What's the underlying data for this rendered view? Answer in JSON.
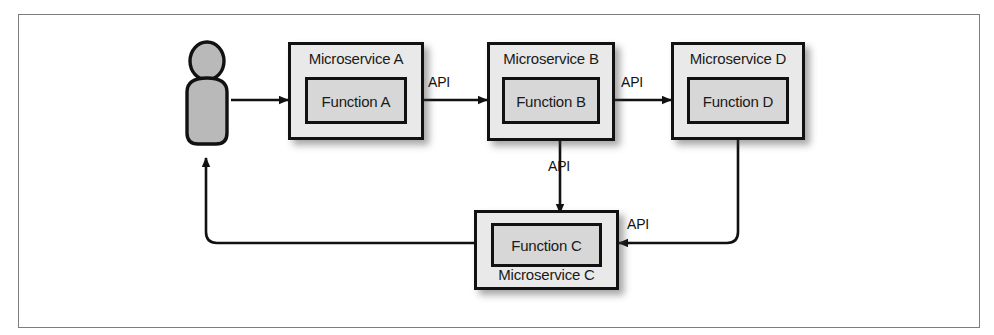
{
  "diagram": {
    "frame": {
      "border_color": "#7d7d7d"
    },
    "colors": {
      "service_fill": "#e9e9e9",
      "function_fill": "#d7d7d7",
      "stroke": "#111111",
      "actor_fill": "#b8b8b8"
    },
    "actor": {
      "name": "user-actor",
      "label": ""
    },
    "services": [
      {
        "id": "a",
        "service_label": "Microservice A",
        "function_label": "Function A",
        "label_position": "top"
      },
      {
        "id": "b",
        "service_label": "Microservice B",
        "function_label": "Function B",
        "label_position": "top"
      },
      {
        "id": "d",
        "service_label": "Microservice D",
        "function_label": "Function D",
        "label_position": "top"
      },
      {
        "id": "c",
        "service_label": "Microservice C",
        "function_label": "Function C",
        "label_position": "bottom"
      }
    ],
    "connections": [
      {
        "id": "user-to-a",
        "label": "",
        "from": "user",
        "to": "Function A"
      },
      {
        "id": "a-to-b",
        "label": "API",
        "from": "Function A",
        "to": "Function B"
      },
      {
        "id": "b-to-d",
        "label": "API",
        "from": "Function B",
        "to": "Function D"
      },
      {
        "id": "b-to-c",
        "label": "API",
        "from": "Function B",
        "to": "Function C"
      },
      {
        "id": "d-to-c",
        "label": "API",
        "from": "Function D",
        "to": "Function C"
      },
      {
        "id": "c-to-user",
        "label": "",
        "from": "Function C",
        "to": "user"
      }
    ]
  }
}
